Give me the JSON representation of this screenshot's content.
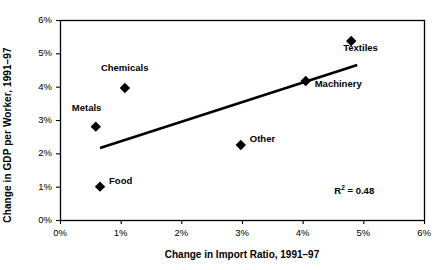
{
  "chart_data": {
    "type": "scatter",
    "title": "",
    "xlabel": "Change in Import Ratio, 1991–97",
    "ylabel": "Change in GDP per Worker, 1991–97",
    "xlim": [
      0,
      6
    ],
    "ylim": [
      0,
      6
    ],
    "xticks": [
      "0%",
      "1%",
      "2%",
      "3%",
      "4%",
      "5%",
      "6%"
    ],
    "yticks": [
      "0%",
      "1%",
      "2%",
      "3%",
      "4%",
      "5%",
      "6%"
    ],
    "xtick_values": [
      0,
      1,
      2,
      3,
      4,
      5,
      6
    ],
    "ytick_values": [
      0,
      1,
      2,
      3,
      4,
      5,
      6
    ],
    "grid": false,
    "legend": "none",
    "marker": "diamond",
    "marker_color": "#000000",
    "points": [
      {
        "label": "Metals",
        "x": 0.59,
        "y": 2.8,
        "label_dx": -24,
        "label_dy": -19
      },
      {
        "label": "Food",
        "x": 0.66,
        "y": 1.0,
        "label_dx": 9,
        "label_dy": -6
      },
      {
        "label": "Chemicals",
        "x": 1.07,
        "y": 3.96,
        "label_dx": -24,
        "label_dy": -20
      },
      {
        "label": "Other",
        "x": 2.98,
        "y": 2.25,
        "label_dx": 9,
        "label_dy": -6
      },
      {
        "label": "Machinery",
        "x": 4.05,
        "y": 4.17,
        "label_dx": 9,
        "label_dy": 3
      },
      {
        "label": "Textiles",
        "x": 4.8,
        "y": 5.37,
        "label_dx": -8,
        "label_dy": 7
      }
    ],
    "trendline": {
      "x_start": 0.66,
      "y_start": 2.16,
      "x_end": 4.9,
      "y_end": 4.65,
      "color": "#000000",
      "width": 2.6
    },
    "annotation": {
      "r2_prefix": "R",
      "r2_superscript": "2",
      "r2_value": " = 0.48",
      "x": 5.05,
      "y": 0.88
    },
    "axis_color": "#000000",
    "plot_background": "#ffffff"
  }
}
